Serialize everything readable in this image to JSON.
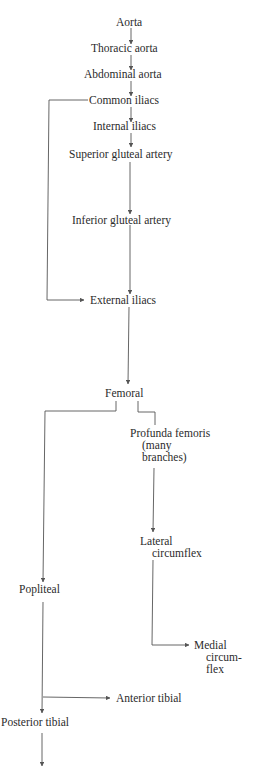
{
  "diagram": {
    "type": "flowchart",
    "title": "",
    "nodes": {
      "aorta": "Aorta",
      "thoracic_aorta": "Thoracic aorta",
      "abdominal_aorta": "Abdominal aorta",
      "common_iliacs": "Common iliacs",
      "internal_iliacs": "Internal iliacs",
      "superior_gluteal": "Superior gluteal artery",
      "inferior_gluteal": "Inferior gluteal artery",
      "external_iliacs": "External iliacs",
      "femoral": "Femoral",
      "profunda_femoris": {
        "line1": "Profunda femoris",
        "line2": "(many",
        "line3": "branches)"
      },
      "lateral_circumflex": {
        "line1": "Lateral",
        "line2": "circumflex"
      },
      "medial_circumflex": {
        "line1": "Medial",
        "line2": "circum-",
        "line3": "flex"
      },
      "popliteal": "Popliteal",
      "anterior_tibial": "Anterior tibial",
      "posterior_tibial": "Posterior tibial"
    },
    "edges": [
      [
        "Aorta",
        "Thoracic aorta"
      ],
      [
        "Thoracic aorta",
        "Abdominal aorta"
      ],
      [
        "Abdominal aorta",
        "Common iliacs"
      ],
      [
        "Common iliacs",
        "Internal iliacs"
      ],
      [
        "Internal iliacs",
        "Superior gluteal artery"
      ],
      [
        "Superior gluteal artery",
        "Inferior gluteal artery"
      ],
      [
        "Inferior gluteal artery",
        "External iliacs"
      ],
      [
        "Common iliacs",
        "External iliacs"
      ],
      [
        "External iliacs",
        "Femoral"
      ],
      [
        "Femoral",
        "Profunda femoris"
      ],
      [
        "Femoral",
        "Popliteal"
      ],
      [
        "Profunda femoris",
        "Lateral circumflex"
      ],
      [
        "Lateral circumflex",
        "Medial circumflex"
      ],
      [
        "Popliteal",
        "Anterior tibial"
      ],
      [
        "Popliteal",
        "Posterior tibial"
      ],
      [
        "Posterior tibial",
        "(continues)"
      ]
    ],
    "colors": {
      "text": "#2b2b2b",
      "line": "#555555",
      "background": "#ffffff"
    }
  }
}
